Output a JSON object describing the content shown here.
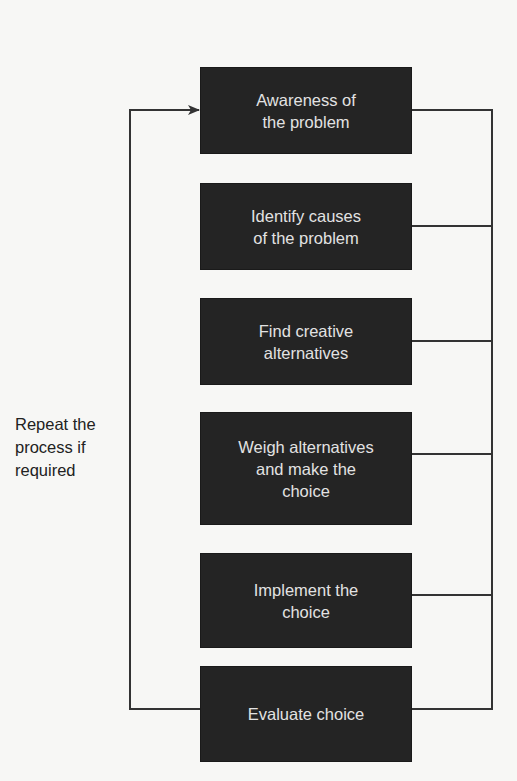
{
  "diagram": {
    "type": "flowchart",
    "title": "",
    "steps": [
      {
        "id": "awareness",
        "label": "Awareness of\nthe problem"
      },
      {
        "id": "identify-causes",
        "label": "Identify causes\nof the problem"
      },
      {
        "id": "find-alternatives",
        "label": "Find creative\nalternatives"
      },
      {
        "id": "weigh-alternatives",
        "label": "Weigh alternatives\nand make the\nchoice"
      },
      {
        "id": "implement",
        "label": "Implement the\nchoice"
      },
      {
        "id": "evaluate",
        "label": "Evaluate choice"
      }
    ],
    "feedback_loop": {
      "from": "evaluate",
      "to": "awareness",
      "label": "Repeat the\nprocess if\nrequired"
    },
    "right_bus": {
      "connects": [
        "awareness",
        "identify-causes",
        "find-alternatives",
        "weigh-alternatives",
        "implement",
        "evaluate"
      ]
    },
    "colors": {
      "box_fill": "#242424",
      "box_text": "#e2e2e2",
      "line": "#333333",
      "background": "#f7f7f5"
    }
  }
}
